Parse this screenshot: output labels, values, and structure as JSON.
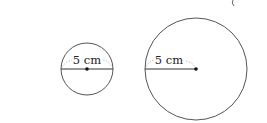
{
  "diagram": {
    "circles": [
      {
        "name": "small-circle",
        "label": "5 cm",
        "measure": "diameter",
        "cx": 87,
        "cy": 69,
        "r": 26
      },
      {
        "name": "large-circle",
        "label": "5 cm",
        "measure": "radius",
        "cx": 196,
        "cy": 69,
        "r": 51
      }
    ],
    "colors": {
      "stroke": "#555555",
      "line": "#333333",
      "dashed": "#aaaaaa",
      "text": "#222222"
    }
  }
}
